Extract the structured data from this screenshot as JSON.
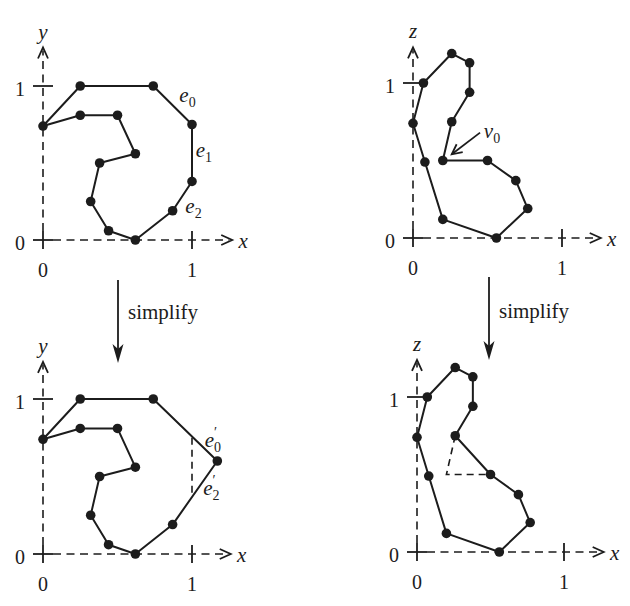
{
  "figure": {
    "steps": [
      {
        "label": "simplify",
        "from_panel": "top-left",
        "to_panel": "bottom-left"
      },
      {
        "label": "simplify",
        "from_panel": "top-right",
        "to_panel": "bottom-right"
      }
    ],
    "panels": [
      {
        "id": "top-left",
        "stage": "original",
        "axes": {
          "horizontal": "x",
          "vertical": "y",
          "extent": [
            1.27,
            1.25
          ]
        },
        "ticks": {
          "horizontal": [
            {
              "value": 0,
              "label": "0"
            },
            {
              "value": 1,
              "label": "1"
            }
          ],
          "vertical": [
            {
              "value": 0,
              "label": "0"
            },
            {
              "value": 1,
              "label": "1"
            }
          ]
        },
        "polygon": [
          [
            0,
            0.74
          ],
          [
            0.25,
            1.0
          ],
          [
            0.74,
            1.0
          ],
          [
            1.0,
            0.75
          ],
          [
            1.0,
            0.38
          ],
          [
            0.87,
            0.19
          ],
          [
            0.62,
            0.0
          ],
          [
            0.44,
            0.06
          ],
          [
            0.32,
            0.25
          ],
          [
            0.38,
            0.5
          ],
          [
            0.62,
            0.56
          ],
          [
            0.5,
            0.81
          ],
          [
            0.25,
            0.81
          ]
        ],
        "guides": [],
        "edge_labels": [
          {
            "base": "e",
            "sub": "0",
            "prime": "",
            "at": [
              0.97,
              0.93
            ]
          },
          {
            "base": "e",
            "sub": "1",
            "prime": "",
            "at": [
              1.08,
              0.57
            ]
          },
          {
            "base": "e",
            "sub": "2",
            "prime": "",
            "at": [
              1.01,
              0.21
            ]
          }
        ],
        "callouts": []
      },
      {
        "id": "top-right",
        "stage": "original",
        "axes": {
          "horizontal": "x",
          "vertical": "z",
          "extent": [
            1.26,
            1.23
          ]
        },
        "ticks": {
          "horizontal": [
            {
              "value": 0,
              "label": "0"
            },
            {
              "value": 1,
              "label": "1"
            }
          ],
          "vertical": [
            {
              "value": 0,
              "label": "0"
            },
            {
              "value": 1,
              "label": "1"
            }
          ]
        },
        "polygon": [
          [
            0.07,
            1.0
          ],
          [
            0.26,
            1.19
          ],
          [
            0.38,
            1.13
          ],
          [
            0.38,
            0.94
          ],
          [
            0.26,
            0.75
          ],
          [
            0.2,
            0.5
          ],
          [
            0.5,
            0.5
          ],
          [
            0.69,
            0.37
          ],
          [
            0.77,
            0.19
          ],
          [
            0.56,
            0.0
          ],
          [
            0.2,
            0.12
          ],
          [
            0.08,
            0.49
          ],
          [
            0.0,
            0.74
          ]
        ],
        "guides": [],
        "edge_labels": [],
        "callouts": [
          {
            "label": {
              "base": "v",
              "sub": "0",
              "prime": ""
            },
            "at": [
              0.53,
              0.68
            ],
            "arrow_from": [
              0.45,
              0.68
            ],
            "arrow_to": [
              0.26,
              0.54
            ]
          }
        ]
      },
      {
        "id": "bottom-left",
        "stage": "simplified",
        "axes": {
          "horizontal": "x",
          "vertical": "y",
          "extent": [
            1.26,
            1.24
          ]
        },
        "ticks": {
          "horizontal": [
            {
              "value": 0,
              "label": "0"
            },
            {
              "value": 1,
              "label": "1"
            }
          ],
          "vertical": [
            {
              "value": 0,
              "label": "0"
            },
            {
              "value": 1,
              "label": "1"
            }
          ]
        },
        "polygon": [
          [
            0,
            0.74
          ],
          [
            0.25,
            1.0
          ],
          [
            0.74,
            1.0
          ],
          [
            1.17,
            0.6
          ],
          [
            0.87,
            0.19
          ],
          [
            0.62,
            0.0
          ],
          [
            0.44,
            0.06
          ],
          [
            0.32,
            0.25
          ],
          [
            0.38,
            0.5
          ],
          [
            0.62,
            0.56
          ],
          [
            0.5,
            0.81
          ],
          [
            0.25,
            0.81
          ]
        ],
        "guides": [
          [
            [
              1.0,
              0.75
            ],
            [
              1.0,
              0.38
            ]
          ]
        ],
        "edge_labels": [
          {
            "base": "e",
            "sub": "0",
            "prime": "′",
            "at": [
              1.14,
              0.72
            ]
          },
          {
            "base": "e",
            "sub": "2",
            "prime": "′",
            "at": [
              1.13,
              0.41
            ]
          }
        ],
        "callouts": []
      },
      {
        "id": "bottom-right",
        "stage": "simplified",
        "axes": {
          "horizontal": "x",
          "vertical": "z",
          "extent": [
            1.27,
            1.24
          ]
        },
        "ticks": {
          "horizontal": [
            {
              "value": 0,
              "label": "0"
            },
            {
              "value": 1,
              "label": "1"
            }
          ],
          "vertical": [
            {
              "value": 0,
              "label": "0"
            },
            {
              "value": 1,
              "label": "1"
            }
          ]
        },
        "polygon": [
          [
            0.07,
            1.0
          ],
          [
            0.26,
            1.19
          ],
          [
            0.38,
            1.13
          ],
          [
            0.38,
            0.94
          ],
          [
            0.26,
            0.75
          ],
          [
            0.5,
            0.5
          ],
          [
            0.69,
            0.37
          ],
          [
            0.77,
            0.19
          ],
          [
            0.56,
            0.0
          ],
          [
            0.2,
            0.12
          ],
          [
            0.08,
            0.49
          ],
          [
            0.0,
            0.74
          ]
        ],
        "guides": [
          [
            [
              0.26,
              0.75
            ],
            [
              0.2,
              0.5
            ],
            [
              0.5,
              0.5
            ]
          ]
        ],
        "edge_labels": [],
        "callouts": []
      }
    ]
  }
}
